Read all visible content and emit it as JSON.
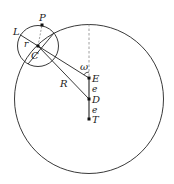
{
  "diagram": {
    "type": "ptolemaic-epicycle-model",
    "colors": {
      "stroke": "#222222",
      "dashed": "#888888",
      "background": "#ffffff"
    },
    "points": {
      "P": {
        "label": "P"
      },
      "L": {
        "label": "L"
      },
      "C": {
        "label": "C"
      },
      "E": {
        "label": "E"
      },
      "D": {
        "label": "D"
      },
      "T": {
        "label": "T"
      }
    },
    "segments": {
      "epicycle_radius": {
        "label": "r"
      },
      "deferent_radius": {
        "label": "R"
      },
      "eccentricity_ED": {
        "label": "e"
      },
      "eccentricity_DT": {
        "label": "e"
      }
    },
    "angles": {
      "equant_angle": {
        "label": "ω"
      }
    }
  }
}
